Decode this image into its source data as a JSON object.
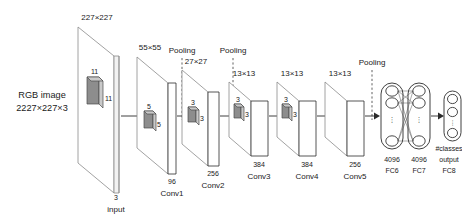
{
  "figure": {
    "type": "diagram"
  },
  "input": {
    "top_label": "227×227",
    "name_left_line1": "RGB image",
    "name_left_line2": "2227×227×3",
    "kernel_top": "11",
    "kernel_side": "11",
    "depth_label": "3",
    "caption": "input"
  },
  "pooling_labels": [
    "Pooling",
    "Pooling",
    "Pooling"
  ],
  "layers": [
    {
      "id": "conv1",
      "size_label": "55×55",
      "kernel_top": "5",
      "kernel_side": "5",
      "channels": "96",
      "caption": "Conv1"
    },
    {
      "id": "conv2",
      "size_label": "27×27",
      "kernel_top": "3",
      "kernel_side": "3",
      "channels": "256",
      "caption": "Conv2"
    },
    {
      "id": "conv3",
      "size_label": "13×13",
      "kernel_top": "3",
      "kernel_side": "3",
      "channels": "384",
      "caption": "Conv3"
    },
    {
      "id": "conv4",
      "size_label": "13×13",
      "kernel_top": "3",
      "kernel_side": "3",
      "channels": "384",
      "caption": "Conv4"
    },
    {
      "id": "conv5",
      "size_label": "13×13",
      "kernel_top": "",
      "kernel_side": "",
      "channels": "256",
      "caption": "Conv5"
    }
  ],
  "fc_layers": [
    {
      "id": "fc6",
      "units": "4096",
      "caption": "FC6",
      "top_label": ""
    },
    {
      "id": "fc7",
      "units": "4096",
      "caption": "FC7",
      "top_label": ""
    },
    {
      "id": "fc8",
      "units": "output",
      "caption": "FC8",
      "top_label": "#classes"
    }
  ],
  "ellipsis": "⋮",
  "colors": {
    "stroke": "#2b2b2b",
    "plane_stroke": "#8a8a8a",
    "kernel_fill": "#8d8d8d",
    "background": "#ffffff"
  }
}
